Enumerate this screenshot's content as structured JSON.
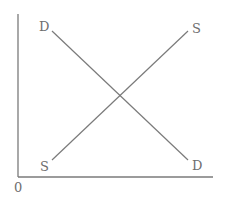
{
  "diagram": {
    "type": "supply-demand",
    "colors": {
      "axis": "#7a7a7a",
      "curve": "#7a7a7a",
      "label": "#6e6e6e",
      "background": "#ffffff"
    },
    "origin_label": "0",
    "demand": {
      "label_start": "D",
      "label_end": "D"
    },
    "supply": {
      "label_start": "S",
      "label_end": "S"
    }
  }
}
